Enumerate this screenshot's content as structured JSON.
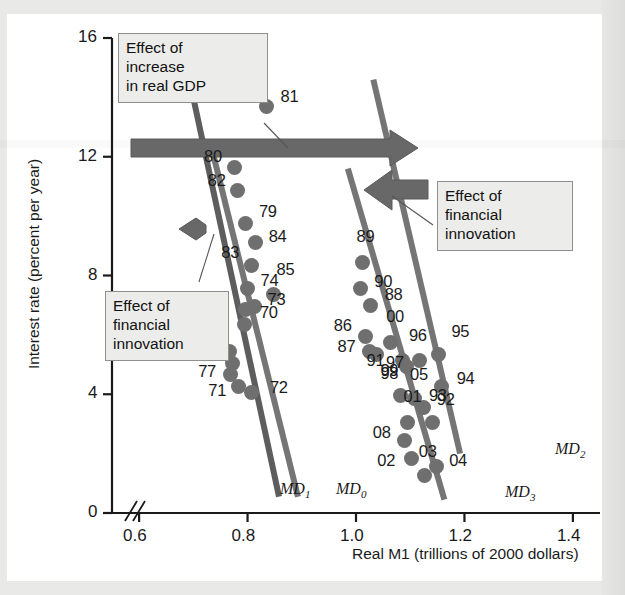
{
  "chart_data": {
    "type": "scatter",
    "title": "",
    "xlabel": "Real M1 (trillions of 2000 dollars)",
    "ylabel": "Interest rate (percent per year)",
    "xlim": [
      0.55,
      1.45
    ],
    "ylim": [
      0,
      16
    ],
    "xticks": [
      "0.6",
      "0.8",
      "1.0",
      "1.2",
      "1.4"
    ],
    "xtick_values": [
      0.6,
      0.8,
      1.0,
      1.2,
      1.4
    ],
    "yticks": [
      "0",
      "4",
      "8",
      "12",
      "16"
    ],
    "ytick_values": [
      0,
      4,
      8,
      12,
      16
    ],
    "grid": false,
    "legend": "none",
    "axis_break_x": true,
    "point_color": "#6f6f6f",
    "line_color": "#6f6f6f",
    "dark_line_color": "#595959",
    "arrow_color": "#636363",
    "points": [
      {
        "label": "81",
        "x": 0.835,
        "y": 13.7
      },
      {
        "label": "80",
        "x": 0.775,
        "y": 11.65
      },
      {
        "label": "82",
        "x": 0.782,
        "y": 10.85
      },
      {
        "label": "79",
        "x": 0.797,
        "y": 9.75
      },
      {
        "label": "84",
        "x": 0.815,
        "y": 9.1
      },
      {
        "label": "83",
        "x": 0.807,
        "y": 8.35
      },
      {
        "label": "74",
        "x": 0.8,
        "y": 7.55
      },
      {
        "label": "85",
        "x": 0.848,
        "y": 7.35
      },
      {
        "label": "73",
        "x": 0.813,
        "y": 6.95
      },
      {
        "label": "70",
        "x": 0.797,
        "y": 6.85
      },
      {
        "label": "70b",
        "x": 0.795,
        "y": 6.35
      },
      {
        "label": "75",
        "x": 0.767,
        "y": 5.45
      },
      {
        "label": "76",
        "x": 0.772,
        "y": 5.05
      },
      {
        "label": "77",
        "x": 0.768,
        "y": 4.65
      },
      {
        "label": "71",
        "x": 0.783,
        "y": 4.25
      },
      {
        "label": "72",
        "x": 0.808,
        "y": 4.05
      },
      {
        "label": "89",
        "x": 1.012,
        "y": 8.45
      },
      {
        "label": "90",
        "x": 1.008,
        "y": 7.55
      },
      {
        "label": "88",
        "x": 1.027,
        "y": 7.0
      },
      {
        "label": "86",
        "x": 1.018,
        "y": 5.95
      },
      {
        "label": "87",
        "x": 1.025,
        "y": 5.45
      },
      {
        "label": "00",
        "x": 1.063,
        "y": 5.75
      },
      {
        "label": "91",
        "x": 1.038,
        "y": 5.35
      },
      {
        "label": "97",
        "x": 1.085,
        "y": 5.15
      },
      {
        "label": "99",
        "x": 1.093,
        "y": 4.95
      },
      {
        "label": "96",
        "x": 1.118,
        "y": 5.15
      },
      {
        "label": "95",
        "x": 1.152,
        "y": 5.35
      },
      {
        "label": "98",
        "x": 1.082,
        "y": 3.95
      },
      {
        "label": "05",
        "x": 1.107,
        "y": 3.85
      },
      {
        "label": "92",
        "x": 1.125,
        "y": 3.55
      },
      {
        "label": "94",
        "x": 1.158,
        "y": 4.25
      },
      {
        "label": "93",
        "x": 1.142,
        "y": 3.05
      },
      {
        "label": "01",
        "x": 1.095,
        "y": 3.05
      },
      {
        "label": "08",
        "x": 1.09,
        "y": 2.45
      },
      {
        "label": "02",
        "x": 1.102,
        "y": 1.85
      },
      {
        "label": "03",
        "x": 1.127,
        "y": 1.25
      },
      {
        "label": "04",
        "x": 1.148,
        "y": 1.55
      }
    ],
    "curves": [
      {
        "name": "MD1",
        "label": "MD",
        "sub": "1",
        "x1": 0.688,
        "y1": 15.0,
        "x2": 0.858,
        "y2": 0.55
      },
      {
        "name": "MD0",
        "label": "MD",
        "sub": "0",
        "x1": 0.735,
        "y1": 12.2,
        "x2": 0.893,
        "y2": 0.55
      },
      {
        "name": "MD2",
        "label": "MD",
        "sub": "2",
        "x1": 1.032,
        "y1": 14.6,
        "x2": 1.192,
        "y2": 2.0
      },
      {
        "name": "MD3",
        "label": "MD",
        "sub": "3",
        "x1": 0.985,
        "y1": 11.6,
        "x2": 1.163,
        "y2": 0.45
      }
    ],
    "annotations": [
      {
        "id": "gdp-effect",
        "text": "Effect of\nincrease\nin real GDP"
      },
      {
        "id": "fin-innov-left",
        "text": "Effect of\nfinancial\ninnovation"
      },
      {
        "id": "fin-innov-right",
        "text": "Effect of\nfinancial\ninnovation"
      }
    ],
    "arrows": [
      {
        "id": "gdp-arrow",
        "direction": "right",
        "meaning": "Effect of increase in real GDP"
      },
      {
        "id": "fin-innov-arrow-right",
        "direction": "left",
        "meaning": "Effect of financial innovation"
      },
      {
        "id": "fin-innov-arrow-left",
        "direction": "left",
        "meaning": "Effect of financial innovation"
      }
    ]
  }
}
